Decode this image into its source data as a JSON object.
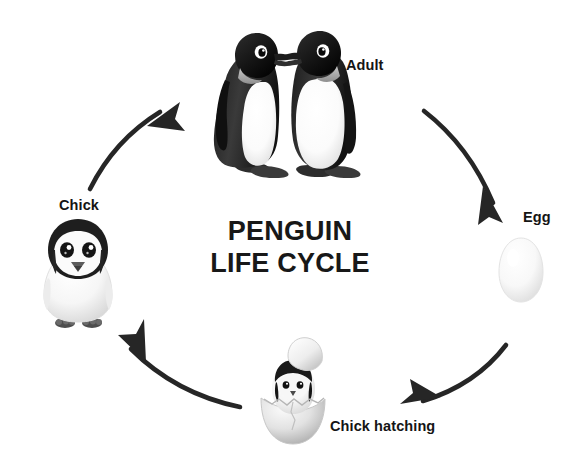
{
  "canvas": {
    "width": 587,
    "height": 468,
    "background": "#ffffff"
  },
  "title": {
    "line1": "PENGUIN",
    "line2": "LIFE CYCLE",
    "color": "#181818"
  },
  "diagram": {
    "kind": "life-cycle",
    "direction": "clockwise",
    "arrow_color": "#262626",
    "stages": [
      {
        "id": "adult",
        "label": "Adult",
        "illustration": "two-adult-penguins",
        "position": "top"
      },
      {
        "id": "egg",
        "label": "Egg",
        "illustration": "white-egg",
        "position": "right"
      },
      {
        "id": "chick-hatching",
        "label": "Chick hatching",
        "illustration": "chick-in-cracked-egg",
        "position": "bottom"
      },
      {
        "id": "chick",
        "label": "Chick",
        "illustration": "fluffy-grey-chick",
        "position": "left"
      }
    ],
    "arrows": [
      {
        "id": "adult-to-egg",
        "from": "adult",
        "to": "egg"
      },
      {
        "id": "egg-to-chick-hatching",
        "from": "egg",
        "to": "chick-hatching"
      },
      {
        "id": "chick-hatching-to-chick",
        "from": "chick-hatching",
        "to": "chick"
      },
      {
        "id": "chick-to-adult",
        "from": "chick",
        "to": "adult"
      }
    ]
  }
}
